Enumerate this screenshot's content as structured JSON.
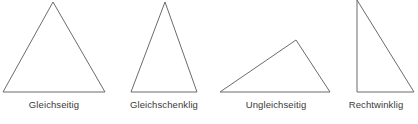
{
  "figure": {
    "width": 418,
    "height": 124,
    "background_color": "#ffffff",
    "stroke_color": "#6b6b6b",
    "stroke_width": 1,
    "label_color": "#3a3a3a"
  },
  "chart_data": {
    "type": "diagram",
    "title": "",
    "items": [
      {
        "label": "Gleichseitig",
        "shape": "triangle",
        "variant": "equilateral",
        "points": "3,92 53,2 105,92"
      },
      {
        "label": "Gleichschenklig",
        "shape": "triangle",
        "variant": "isosceles",
        "points": "131,92 165,2 197,92"
      },
      {
        "label": "Ungleichseitig",
        "shape": "triangle",
        "variant": "scalene",
        "points": "220,92 296,40 330,92"
      },
      {
        "label": "Rechtwinklig",
        "shape": "triangle",
        "variant": "right-angled",
        "points": "357,0 357,92 414,92"
      }
    ]
  }
}
